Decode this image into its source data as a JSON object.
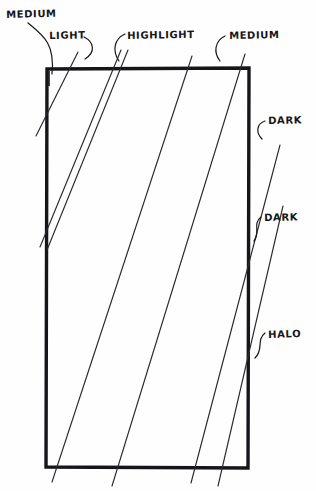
{
  "diagram": {
    "background_color": "#fefefe",
    "ink_color": "#16161a",
    "panel": {
      "name": "rectangle-panel",
      "x": 46,
      "y": 68,
      "width": 203,
      "height": 400,
      "stroke_width": 3
    },
    "streak_lines": [
      {
        "id": "streak-1",
        "x1": 78,
        "y1": 52,
        "x2": 36,
        "y2": 136
      },
      {
        "id": "streak-2",
        "x1": 121,
        "y1": 50,
        "x2": 40,
        "y2": 247
      },
      {
        "id": "streak-3",
        "x1": 128,
        "y1": 50,
        "x2": 47,
        "y2": 250
      },
      {
        "id": "streak-4",
        "x1": 192,
        "y1": 56,
        "x2": 52,
        "y2": 482
      },
      {
        "id": "streak-5",
        "x1": 245,
        "y1": 54,
        "x2": 112,
        "y2": 486
      },
      {
        "id": "streak-6",
        "x1": 280,
        "y1": 145,
        "x2": 191,
        "y2": 483
      },
      {
        "id": "streak-7",
        "x1": 283,
        "y1": 206,
        "x2": 218,
        "y2": 486
      }
    ],
    "leader_lines": [
      {
        "id": "leader-medium-topleft",
        "path": "M 30 22 C 46 38, 54 44, 52 74"
      },
      {
        "id": "leader-light",
        "path": "M 86 36 C 95 42, 96 52, 86 58"
      },
      {
        "id": "leader-highlight",
        "path": "M 124 34 C 113 40, 113 52, 119 60"
      },
      {
        "id": "leader-medium-topright",
        "path": "M 224 36 C 214 42, 214 52, 220 60"
      },
      {
        "id": "leader-dark-upper",
        "path": "M 266 122 C 257 124, 256 132, 262 138"
      },
      {
        "id": "leader-dark-lower",
        "path": "M 262 218 C 253 224, 262 232, 255 240"
      },
      {
        "id": "leader-halo",
        "path": "M 266 334 C 257 340, 265 350, 256 357"
      }
    ],
    "labels": {
      "medium_topleft": "MEDIUM",
      "light": "LIGHT",
      "highlight": "HIGHLIGHT",
      "medium_topright": "MEDIUM",
      "dark_upper": "DARK",
      "dark_lower": "DARK",
      "halo": "HALO"
    }
  }
}
